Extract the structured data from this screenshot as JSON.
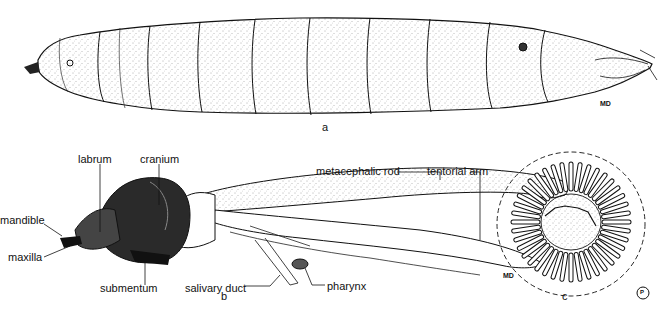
{
  "figure": {
    "panels": [
      {
        "id": "a",
        "label": "a",
        "description": "larva, lateral view",
        "initials": "MD"
      },
      {
        "id": "b",
        "label": "b",
        "description": "cephalopharyngeal skeleton",
        "initials": "MD",
        "labels": [
          "labrum",
          "cranium",
          "mandible",
          "maxilla",
          "submentum",
          "salivary duct",
          "pharynx",
          "metacephalic rod",
          "tentorial arm"
        ]
      },
      {
        "id": "c",
        "label": "c",
        "description": "posterior spiracle",
        "initials": "P"
      }
    ]
  },
  "colors": {
    "ink": "#111111",
    "stipple": "#555555",
    "dark_fill": "#2a2a2a",
    "paper": "#ffffff"
  }
}
